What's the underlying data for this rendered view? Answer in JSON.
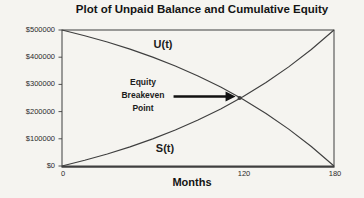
{
  "title": "Plot of Unpaid Balance and Cumulative Equity",
  "colors": {
    "line": "#3f3f3f",
    "arrow": "#111111",
    "text": "#1c1c1c",
    "background": "#f5f4f0"
  },
  "annotations": {
    "u_label": "U(t)",
    "s_label": "S(t)",
    "breakeven_line1": "Equity",
    "breakeven_line2": "Breakeven",
    "breakeven_line3": "Point"
  },
  "chart_data": {
    "type": "line",
    "title": "Plot of Unpaid Balance and Cumulative Equity",
    "xlabel": "Months",
    "ylabel": "",
    "xlim": [
      0,
      180
    ],
    "ylim": [
      0,
      500000
    ],
    "grid": false,
    "legend": "none",
    "xticks": [
      "0",
      "120",
      "180"
    ],
    "xtick_values": [
      0,
      120,
      180
    ],
    "yticks": [
      "$500000",
      "$400000",
      "$300000",
      "$200000",
      "$100000",
      "$0"
    ],
    "ytick_values": [
      0,
      100000,
      200000,
      300000,
      400000,
      500000
    ],
    "x": [
      0,
      15,
      30,
      45,
      60,
      75,
      90,
      105,
      120,
      135,
      150,
      165,
      180
    ],
    "series": [
      {
        "name": "U(t)",
        "description": "Unpaid balance",
        "values": [
          500000,
          479100,
          455700,
          429600,
          400300,
          367600,
          331000,
          290100,
          244300,
          193100,
          135800,
          71700,
          0
        ]
      },
      {
        "name": "S(t)",
        "description": "Cumulative equity",
        "values": [
          0,
          20900,
          44300,
          70400,
          99700,
          132400,
          169000,
          209900,
          255700,
          306900,
          364200,
          428300,
          500000
        ]
      }
    ],
    "breakeven_point": {
      "x": 117.5,
      "y": 250000,
      "label": "Equity Breakeven Point"
    }
  }
}
